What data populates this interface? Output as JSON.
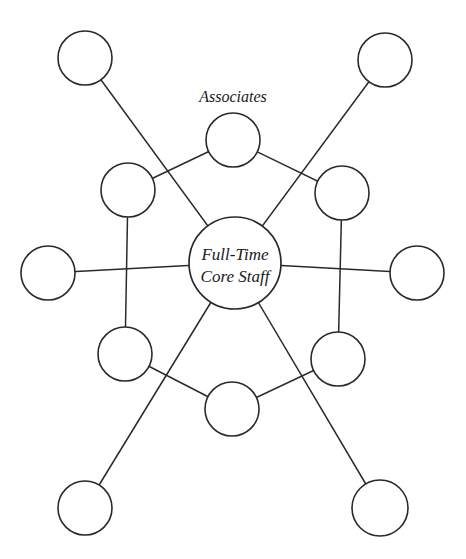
{
  "diagram": {
    "type": "network",
    "background": "#ffffff",
    "stroke_color": "#2a2a2a",
    "labels": {
      "associates": "Associates",
      "core_line1": "Full-Time",
      "core_line2": "Core Staff"
    },
    "core": {
      "id": "core",
      "cx": 235,
      "cy": 263,
      "r": 46
    },
    "nodes": [
      {
        "id": "outer-top-left",
        "cx": 85,
        "cy": 58,
        "r": 27
      },
      {
        "id": "outer-top-right",
        "cx": 385,
        "cy": 60,
        "r": 27
      },
      {
        "id": "assoc-top",
        "cx": 233,
        "cy": 140,
        "r": 27
      },
      {
        "id": "assoc-upper-left",
        "cx": 128,
        "cy": 190,
        "r": 27
      },
      {
        "id": "assoc-upper-right",
        "cx": 342,
        "cy": 193,
        "r": 27
      },
      {
        "id": "outer-left",
        "cx": 48,
        "cy": 273,
        "r": 27
      },
      {
        "id": "outer-right",
        "cx": 417,
        "cy": 273,
        "r": 27
      },
      {
        "id": "assoc-lower-left",
        "cx": 125,
        "cy": 354,
        "r": 27
      },
      {
        "id": "assoc-lower-right",
        "cx": 338,
        "cy": 359,
        "r": 27
      },
      {
        "id": "assoc-bottom",
        "cx": 232,
        "cy": 409,
        "r": 27
      },
      {
        "id": "outer-bottom-left",
        "cx": 85,
        "cy": 508,
        "r": 27
      },
      {
        "id": "outer-bottom-right",
        "cx": 380,
        "cy": 508,
        "r": 28
      }
    ],
    "edges": [
      {
        "from": "core",
        "to": "outer-top-left"
      },
      {
        "from": "core",
        "to": "outer-top-right"
      },
      {
        "from": "core",
        "to": "outer-left"
      },
      {
        "from": "core",
        "to": "outer-right"
      },
      {
        "from": "core",
        "to": "outer-bottom-left"
      },
      {
        "from": "core",
        "to": "outer-bottom-right"
      },
      {
        "from": "assoc-top",
        "to": "assoc-upper-left"
      },
      {
        "from": "assoc-top",
        "to": "assoc-upper-right"
      },
      {
        "from": "assoc-upper-left",
        "to": "assoc-lower-left"
      },
      {
        "from": "assoc-upper-right",
        "to": "assoc-lower-right"
      },
      {
        "from": "assoc-lower-left",
        "to": "assoc-bottom"
      },
      {
        "from": "assoc-lower-right",
        "to": "assoc-bottom"
      }
    ]
  }
}
